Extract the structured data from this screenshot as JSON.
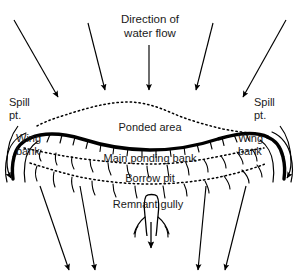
{
  "figure": {
    "type": "schematic-diagram",
    "background_color": "#ffffff",
    "line_color": "#000000",
    "text_color": "#1a1a1a",
    "width": 299,
    "height": 280
  },
  "labels": {
    "title": "Direction of\nwater flow",
    "spill_point_left": "Spill\npt.",
    "spill_point_right": "Spill\npt.",
    "ponded_area": "Ponded area",
    "wing_bank_left": "Wing\nbank",
    "wing_bank_right": "Wing\nbank",
    "main_ponding_bank": "Main ponding bank",
    "borrow_pit": "Borrow pit",
    "remnant_gully": "Remnant gully"
  },
  "features": [
    {
      "name": "inflow-arrows",
      "label": "Direction of water flow",
      "count": 5,
      "description": "Arrows entering from the top, converging toward the ponded area"
    },
    {
      "name": "ponded-area-boundary",
      "style": "dotted",
      "description": "Dotted outline enclosing the ponded area upslope of the main bank"
    },
    {
      "name": "main-ponding-bank",
      "style": "thick-solid-curve",
      "description": "Heavy curved line forming the main ponding bank with downslope tick hachures"
    },
    {
      "name": "wing-bank-left",
      "style": "thick-solid-curve",
      "description": "Left wing bank curving downslope from the spill point"
    },
    {
      "name": "wing-bank-right",
      "style": "thick-solid-curve",
      "description": "Right wing bank curving downslope from the spill point"
    },
    {
      "name": "borrow-pit",
      "style": "dotted",
      "description": "Dotted band downslope of the main ponding bank"
    },
    {
      "name": "remnant-gully",
      "style": "solid-outline",
      "description": "Narrow gully channel with branching tributaries below the borrow pit"
    },
    {
      "name": "outflow-arrows",
      "count": 5,
      "description": "Arrows leaving downslope below the bank and gully"
    }
  ],
  "colors": {
    "stroke": "#000000",
    "text": "#1a1a1a",
    "background": "#ffffff"
  }
}
